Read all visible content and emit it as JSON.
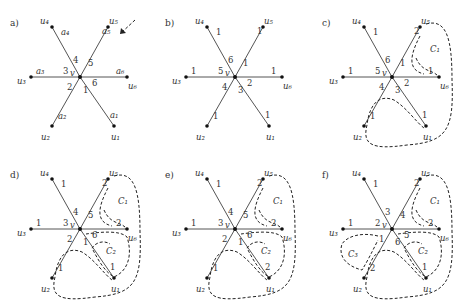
{
  "figure": {
    "panels": [
      {
        "id": "a",
        "label": "a)",
        "vertices": [
          "u1",
          "u2",
          "u3",
          "u4",
          "u5",
          "u6"
        ],
        "center": "v",
        "edge_end_labels": {
          "u1": "a1",
          "u2": "a2",
          "u3": "a3",
          "u4": "a4",
          "u5": "a5",
          "u6": "a6"
        },
        "edge_center_labels": {
          "u1": "1",
          "u2": "2",
          "u3": "3",
          "u4": "4",
          "u5": "5",
          "u6": "6"
        },
        "arrow_hint": true,
        "cycles": []
      },
      {
        "id": "b",
        "label": "b)",
        "vertices": [
          "u1",
          "u2",
          "u3",
          "u4",
          "u5",
          "u6"
        ],
        "center": "v",
        "edge_end_labels": {
          "u1": "1",
          "u2": "1",
          "u3": "1",
          "u4": "1",
          "u5": "1",
          "u6": "1"
        },
        "edge_center_labels": {
          "u1": "3",
          "u2": "4",
          "u3": "5",
          "u4": "6",
          "u5": "1",
          "u6": "2"
        },
        "cycles": []
      },
      {
        "id": "c",
        "label": "c)",
        "vertices": [
          "u1",
          "u2",
          "u3",
          "u4",
          "u5",
          "u6"
        ],
        "center": "v",
        "edge_end_labels": {
          "u1": "1",
          "u2": "1",
          "u3": "1",
          "u4": "1",
          "u5": "2",
          "u6": "1"
        },
        "edge_center_labels": {
          "u1": "3",
          "u2": "4",
          "u3": "5",
          "u4": "6",
          "u5": "1",
          "u6": "2"
        },
        "cycles": [
          "C1"
        ]
      },
      {
        "id": "d",
        "label": "d)",
        "vertices": [
          "u1",
          "u2",
          "u3",
          "u4",
          "u5",
          "u6"
        ],
        "center": "v",
        "edge_end_labels": {
          "u1": "1",
          "u2": "1",
          "u3": "1",
          "u4": "1",
          "u5": "2",
          "u6": "2"
        },
        "edge_center_labels": {
          "u1": "1",
          "u2": "2",
          "u3": "3",
          "u4": "4",
          "u5": "5",
          "u6": "6"
        },
        "cycles": [
          "C1",
          "C2"
        ]
      },
      {
        "id": "e",
        "label": "e)",
        "vertices": [
          "u1",
          "u2",
          "u3",
          "u4",
          "u5",
          "u6"
        ],
        "center": "v",
        "edge_end_labels": {
          "u1": "2",
          "u2": "1",
          "u3": "1",
          "u4": "1",
          "u5": "2",
          "u6": "2"
        },
        "edge_center_labels": {
          "u1": "1",
          "u2": "2",
          "u3": "3",
          "u4": "4",
          "u5": "5",
          "u6": "6"
        },
        "cycles": [
          "C1",
          "C2"
        ]
      },
      {
        "id": "f",
        "label": "f)",
        "vertices": [
          "u1",
          "u2",
          "u3",
          "u4",
          "u5",
          "u6"
        ],
        "center": "v",
        "edge_end_labels": {
          "u1": "1",
          "u2": "2",
          "u3": "1",
          "u4": "1",
          "u5": "2",
          "u6": "2"
        },
        "edge_center_labels": {
          "u1": "6",
          "u2": "1",
          "u3": "2",
          "u4": "3",
          "u5": "4",
          "u6": "5"
        },
        "cycles": [
          "C1",
          "C2",
          "C3"
        ]
      }
    ],
    "vertex_names": {
      "u1": "u₁",
      "u2": "u₂",
      "u3": "u₃",
      "u4": "u₄",
      "u5": "u₅",
      "u6": "u₆",
      "v": "v"
    },
    "edge_end_names": {
      "a1": "a₁",
      "a2": "a₂",
      "a3": "a₃",
      "a4": "a₄",
      "a5": "a₅",
      "a6": "a₆"
    },
    "cycle_names": {
      "C1": "C₁",
      "C2": "C₂",
      "C3": "C₃"
    }
  }
}
